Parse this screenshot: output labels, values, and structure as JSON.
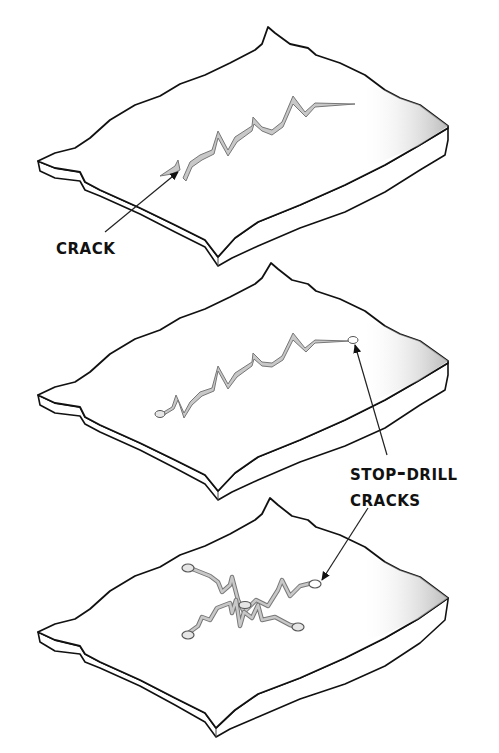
{
  "diagram": {
    "panels": [
      {
        "id": "panel-1",
        "description": "Plate with an untreated crack"
      },
      {
        "id": "panel-2",
        "description": "Plate with crack ends stop-drilled"
      },
      {
        "id": "panel-3",
        "description": "Plate with branching crack, all ends stop-drilled"
      }
    ],
    "labels": {
      "crack": "Crack",
      "stop_drill_line1": "Stop-Drill",
      "stop_drill_line2": "Cracks"
    },
    "colors": {
      "outline": "#111111",
      "crack_fill": "#c8c8c8",
      "crack_edge": "#777777",
      "shade": "#b8b8b8",
      "background": "#ffffff"
    }
  }
}
